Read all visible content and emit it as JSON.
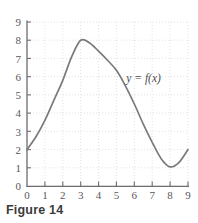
{
  "figure": {
    "caption": "Figure 14",
    "curve_label": "y = f(x)",
    "top_artifact_text": ". . ."
  },
  "colors": {
    "curve": "#7a7a7c",
    "axis": "#6e6e70",
    "grid": "#e2e2e6",
    "tick_text": "#58585a",
    "caption_text": "#3b3b3d",
    "background": "#ffffff"
  },
  "chart_data": {
    "type": "line",
    "title": "",
    "subtitle": "",
    "xlabel": "",
    "ylabel": "",
    "xlim": [
      0,
      9
    ],
    "ylim": [
      0,
      9
    ],
    "grid": true,
    "legend": false,
    "legend_position": "none",
    "xticks": [
      0,
      1,
      2,
      3,
      4,
      5,
      6,
      7,
      8,
      9
    ],
    "yticks": [
      0,
      1,
      2,
      3,
      4,
      5,
      6,
      7,
      8,
      9
    ],
    "xtick_labels": [
      "0",
      "1",
      "2",
      "3",
      "4",
      "5",
      "6",
      "7",
      "8",
      "9"
    ],
    "ytick_labels": [
      "0",
      "1",
      "2",
      "3",
      "4",
      "5",
      "6",
      "7",
      "8",
      "9"
    ],
    "annotations": [
      {
        "text": "y = f(x)",
        "x": 5.55,
        "y": 5.72
      }
    ],
    "series": [
      {
        "name": "f",
        "label": "y = f(x)",
        "x": [
          0,
          0.5,
          1,
          1.5,
          2,
          2.5,
          3,
          3.5,
          4,
          4.5,
          5,
          5.5,
          6,
          6.5,
          7,
          7.5,
          8,
          8.5,
          9
        ],
        "values": [
          2.0,
          2.7,
          3.6,
          4.7,
          5.8,
          7.1,
          8.0,
          7.85,
          7.4,
          6.9,
          6.35,
          5.5,
          4.5,
          3.4,
          2.4,
          1.5,
          1.05,
          1.3,
          2.0
        ]
      }
    ],
    "key_points": {
      "start": [
        0,
        2
      ],
      "maximum": [
        3,
        8
      ],
      "minimum": [
        8,
        1
      ],
      "end": [
        9,
        2
      ]
    }
  }
}
